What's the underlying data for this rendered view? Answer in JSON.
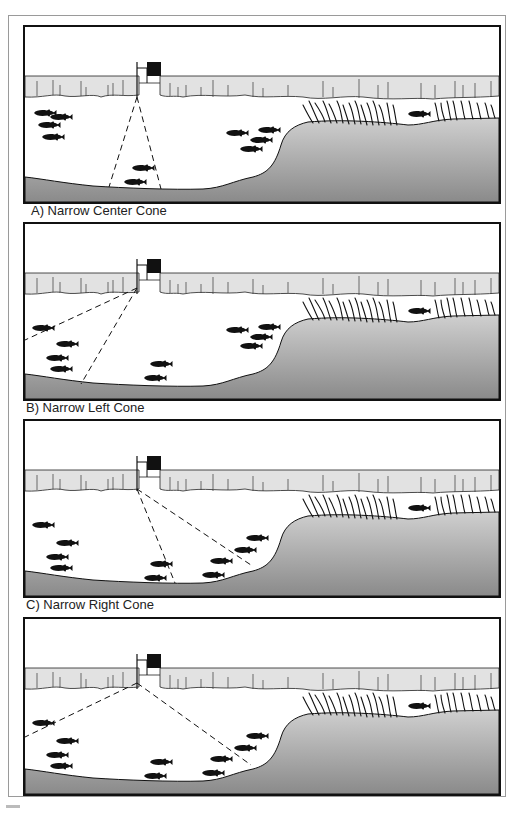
{
  "figure": {
    "panels": [
      {
        "id": "A",
        "label": "A) Narrow Center Cone",
        "cone": "center"
      },
      {
        "id": "B",
        "label": "B) Narrow Left Cone",
        "cone": "left"
      },
      {
        "id": "C",
        "label": "C) Narrow Right Cone",
        "cone": "right"
      },
      {
        "id": "D",
        "label": "",
        "cone": "left-and-right"
      }
    ],
    "colors": {
      "ice": "#e2e2e2",
      "water": "#ffffff",
      "bottom_light": "#c8c8c8",
      "bottom_dark": "#8c8c8c",
      "ink": "#111111",
      "frame": "#9a9a9a"
    }
  }
}
